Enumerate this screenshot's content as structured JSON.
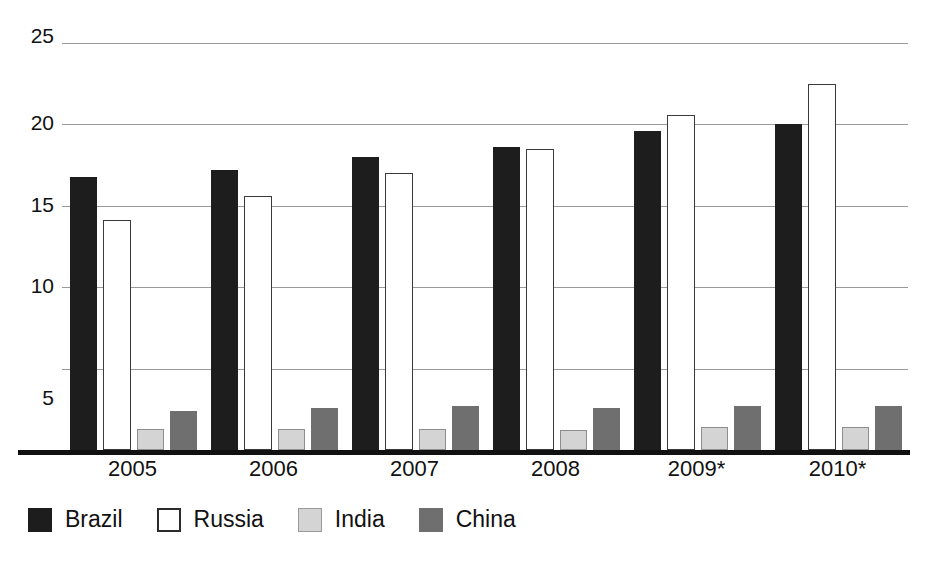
{
  "chart_data": {
    "type": "bar",
    "title": "",
    "subtitle": "",
    "xlabel": "",
    "ylabel": "",
    "categories": [
      "2005",
      "2006",
      "2007",
      "2008",
      "2009*",
      "2010*"
    ],
    "series": [
      {
        "name": "Brazil",
        "color": "#1d1d1d",
        "values": [
          16.8,
          17.2,
          18.0,
          18.6,
          19.6,
          20.0
        ]
      },
      {
        "name": "Russia",
        "color": "#ffffff",
        "values": [
          14.1,
          15.6,
          17.0,
          18.5,
          20.6,
          22.5
        ]
      },
      {
        "name": "India",
        "color": "#d4d4d4",
        "values": [
          1.3,
          1.3,
          1.3,
          1.2,
          1.4,
          1.4
        ]
      },
      {
        "name": "China",
        "color": "#6f6f6f",
        "values": [
          2.4,
          2.6,
          2.7,
          2.6,
          2.7,
          2.7
        ]
      }
    ],
    "ylim": [
      0,
      25
    ],
    "yticks": [
      5,
      10,
      15,
      20,
      25
    ],
    "ytick_labels": [
      "5",
      "10",
      "15",
      "20",
      "25"
    ],
    "grid": true,
    "legend_position": "bottom-left",
    "legend": [
      "Brazil",
      "Russia",
      "India",
      "China"
    ],
    "note": "* denotes forecast years"
  },
  "axis": {
    "y_labels": [
      "25",
      "20",
      "15",
      "10",
      "5"
    ],
    "x_labels": [
      "2005",
      "2006",
      "2007",
      "2008",
      "2009*",
      "2010*"
    ]
  },
  "legend": {
    "items": [
      {
        "label": "Brazil",
        "swatch": "legend-swatch-brazil"
      },
      {
        "label": "Russia",
        "swatch": "legend-swatch-russia"
      },
      {
        "label": "India",
        "swatch": "legend-swatch-india"
      },
      {
        "label": "China",
        "swatch": "legend-swatch-china"
      }
    ]
  }
}
